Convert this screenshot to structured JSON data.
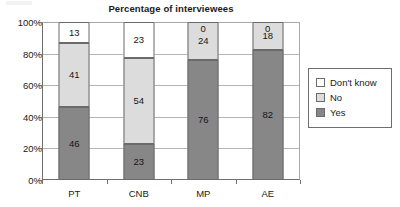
{
  "chart_data": {
    "type": "bar",
    "subtype": "100% stacked column",
    "title": "Percentage of interviewees",
    "xlabel": "",
    "ylabel": "",
    "categories": [
      "PT",
      "CNB",
      "MP",
      "AE"
    ],
    "series": [
      {
        "name": "Yes",
        "color": "#878787",
        "values": [
          46,
          41,
          76,
          82
        ]
      },
      {
        "name": "No",
        "color": "#dcdcdc",
        "values": [
          41,
          54,
          24,
          18
        ]
      },
      {
        "name": "Don't know",
        "color": "#ffffff",
        "values": [
          13,
          23,
          0,
          0
        ]
      }
    ],
    "stack_order_bottom_to_top": [
      "Yes",
      "No",
      "Don't know"
    ],
    "ylim": [
      0,
      100
    ],
    "y_tick_labels": [
      "0%",
      "20%",
      "40%",
      "60%",
      "80%",
      "100%"
    ],
    "y_tick_values": [
      0,
      20,
      40,
      60,
      80,
      100
    ],
    "grid": true,
    "grid_axis": "y",
    "legend_position": "right",
    "legend_entries": [
      "Don't know",
      "No",
      "Yes"
    ],
    "value_labels_shown": true,
    "bars": [
      {
        "category": "PT",
        "segments": [
          {
            "series": "Don't know",
            "value": 13,
            "label": "13"
          },
          {
            "series": "No",
            "value": 41,
            "label": "41"
          },
          {
            "series": "Yes",
            "value": 46,
            "label": "46"
          }
        ]
      },
      {
        "category": "CNB",
        "segments": [
          {
            "series": "Don't know",
            "value": 23,
            "label": "23"
          },
          {
            "series": "No",
            "value": 54,
            "label": "54"
          },
          {
            "series": "Yes",
            "value": 23,
            "label": "23"
          }
        ]
      },
      {
        "category": "MP",
        "segments": [
          {
            "series": "Don't know",
            "value": 0,
            "label": "0"
          },
          {
            "series": "No",
            "value": 24,
            "label": "24"
          },
          {
            "series": "Yes",
            "value": 76,
            "label": "76"
          }
        ]
      },
      {
        "category": "AE",
        "segments": [
          {
            "series": "Don't know",
            "value": 0,
            "label": "0"
          },
          {
            "series": "No",
            "value": 18,
            "label": "18"
          },
          {
            "series": "Yes",
            "value": 82,
            "label": "82"
          }
        ]
      }
    ]
  },
  "colors": {
    "yes": "#878787",
    "no": "#dcdcdc",
    "dont_know": "#ffffff",
    "axis": "#6e6e6e",
    "gridline": "#b5b5b5",
    "text": "#1a1a1a"
  }
}
